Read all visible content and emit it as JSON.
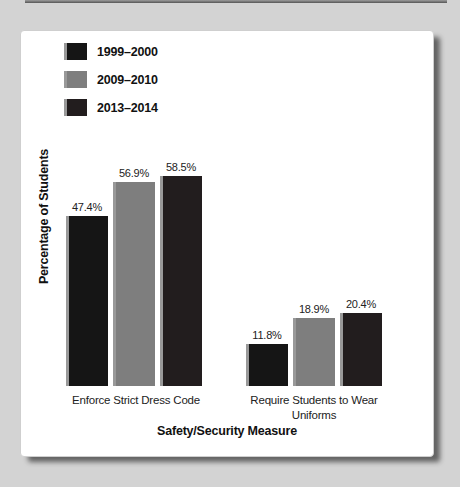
{
  "window": {
    "background_color": "#d3d3d3",
    "card_color": "#ffffff"
  },
  "chart_data": {
    "type": "bar",
    "categories": [
      "Enforce Strict Dress Code",
      "Require Students to Wear Uniforms"
    ],
    "series": [
      {
        "name": "1999–2000",
        "color": "#151515",
        "values": [
          47.4,
          11.8
        ],
        "value_labels": [
          "47.4%",
          "11.8%"
        ]
      },
      {
        "name": "2009–2010",
        "color": "#7e7e7e",
        "values": [
          56.9,
          18.9
        ],
        "value_labels": [
          "56.9%",
          "18.9%"
        ]
      },
      {
        "name": "2013–2014",
        "color": "#221d1e",
        "values": [
          58.5,
          20.4
        ],
        "value_labels": [
          "58.5%",
          "20.4%"
        ]
      }
    ],
    "xlabel": "Safety/Security Measure",
    "ylabel": "Percentage of Students",
    "legend_position": "top-left",
    "grid": false,
    "y_axis_ticks_visible": false
  }
}
